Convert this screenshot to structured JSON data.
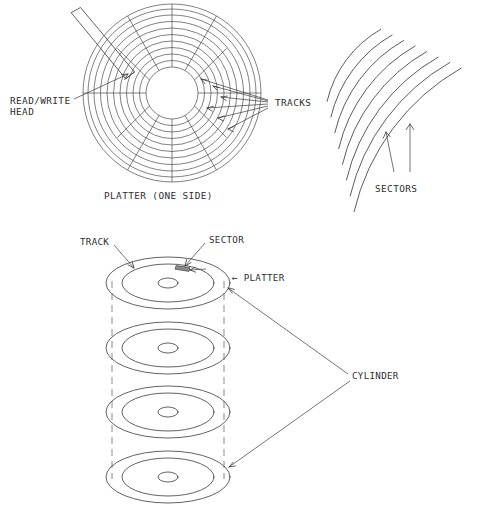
{
  "figure": {
    "title_caption": "PLATTER (ONE SIDE)",
    "labels": {
      "read_write_head_line1": "READ/WRITE",
      "read_write_head_line2": "HEAD",
      "tracks": "TRACKS",
      "sectors": "SECTORS",
      "track": "TRACK",
      "sector": "SECTOR",
      "platter": "← PLATTER",
      "cylinder": "CYLINDER"
    },
    "platter_top_view": {
      "center_x": 172,
      "center_y": 93,
      "track_count": 11,
      "track_radii": [
        26,
        32.5,
        39,
        45.5,
        52,
        58.5,
        65,
        71.5,
        78,
        84,
        89
      ],
      "hub_radius": 26,
      "sector_divider_count": 12,
      "sector_divider_angles_deg": [
        0,
        30,
        60,
        90,
        120,
        150,
        180,
        210,
        240,
        270,
        300,
        330
      ],
      "head_arm": {
        "angle_deg": -56,
        "length": 78,
        "width": 11
      },
      "tracks_leader_count": 6
    },
    "sectors_detail": {
      "arc_count": 8,
      "origin_x": 300,
      "origin_y": 210,
      "arc_radii": [
        112,
        128,
        144,
        160,
        176,
        192,
        208,
        224
      ],
      "arc_start_deg": -76,
      "arc_end_deg": -44,
      "arrow_count": 2
    },
    "cylinder_stack": {
      "platter_count": 4,
      "platter_centers_y": [
        283,
        348,
        412,
        477
      ],
      "platter_center_x": 168,
      "outer_rx": 62,
      "outer_ry": 26,
      "track_rx": 46,
      "track_ry": 19,
      "hub_rx": 10,
      "hub_ry": 5,
      "cylinder_guide_x_left": 112,
      "cylinder_guide_x_right": 224
    },
    "colors": {
      "line": "#3a3a3a",
      "line_light": "#6a6a6a",
      "text": "#2e2e2e",
      "sector_shade": "#8a8a8a",
      "background": "#ffffff"
    }
  }
}
